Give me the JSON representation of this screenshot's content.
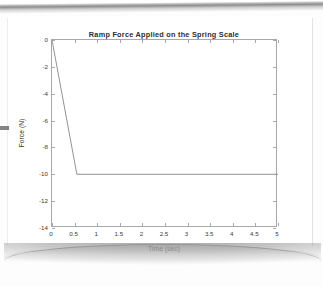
{
  "document": {
    "kind": "scanned-page",
    "page_background": "#ffffff",
    "edge_shadow_color": "#8d8d8d"
  },
  "figure": {
    "title": "Ramp Force Applied on the Spring Scale",
    "xaxis_title": "Time (sec)",
    "yaxis_title": "Force (N)",
    "line_color": "#8a8a8a",
    "axis_color": "#a8a8a8"
  },
  "chart_data": {
    "type": "line",
    "title": "Ramp Force Applied on the Spring Scale",
    "xlabel": "Time (sec)",
    "ylabel": "Force (N)",
    "xlim": [
      0,
      5
    ],
    "ylim": [
      -14,
      0
    ],
    "xticks": [
      0,
      0.5,
      1,
      1.5,
      2,
      2.5,
      3,
      3.5,
      4,
      4.5,
      5
    ],
    "xticklabels": [
      "0",
      "0.5",
      "1",
      "1.5",
      "2",
      "2.5",
      "3",
      "3.5",
      "4",
      "4.5",
      "5"
    ],
    "yticks": [
      0,
      -2,
      -4,
      -6,
      -8,
      -10,
      -12,
      -14
    ],
    "yticklabels": [
      "0",
      "-2",
      "-4",
      "-6",
      "-8",
      "-10",
      "-12",
      "-14"
    ],
    "grid": false,
    "legend": null,
    "box": true,
    "tick_direction": "in",
    "series": [
      {
        "name": "Ramp force",
        "color": "#8a8a8a",
        "x": [
          0,
          0.55,
          5
        ],
        "y": [
          0,
          -10,
          -10
        ]
      }
    ],
    "annotations": [
      "Force ramps linearly from 0 N at t=0 to -10 N at t≈0.55 s, then holds constant at -10 N through t=5 s."
    ]
  }
}
